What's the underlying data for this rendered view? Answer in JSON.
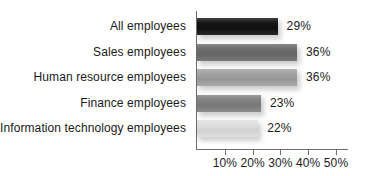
{
  "chart_data": {
    "type": "bar",
    "orientation": "horizontal",
    "title": "",
    "xlabel": "",
    "ylabel": "",
    "categories": [
      "All employees",
      "Sales employees",
      "Human resource employees",
      "Finance employees",
      "Information technology employees"
    ],
    "values": [
      29,
      36,
      36,
      23,
      22
    ],
    "value_labels": [
      "29%",
      "36%",
      "36%",
      "23%",
      "22%"
    ],
    "bar_colors": [
      "#111111",
      "#6b6b6b",
      "#a0a0a0",
      "#808080",
      "#dedede"
    ],
    "xlim": [
      0,
      55
    ],
    "xticks": [
      10,
      20,
      30,
      40,
      50
    ],
    "xtick_labels": [
      "10%",
      "20%",
      "30%",
      "40%",
      "50%"
    ],
    "grid": false,
    "legend": false,
    "axis_color": "#6e6e6e"
  },
  "title_remnant": "",
  "rows": [
    {
      "label": "All employees",
      "value_label": "29%"
    },
    {
      "label": "Sales employees",
      "value_label": "36%"
    },
    {
      "label": "Human resource employees",
      "value_label": "36%"
    },
    {
      "label": "Finance employees",
      "value_label": "23%"
    },
    {
      "label": "Information technology employees",
      "value_label": "22%"
    }
  ],
  "xtick_labels": [
    "10%",
    "20%",
    "30%",
    "40%",
    "50%"
  ]
}
